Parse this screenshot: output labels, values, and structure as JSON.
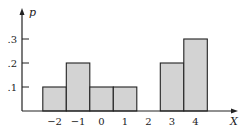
{
  "chart_data": {
    "type": "bar",
    "title": "",
    "xlabel": "X",
    "ylabel": "p",
    "categories": [
      "-2",
      "-1",
      "0",
      "1",
      "2",
      "3",
      "4"
    ],
    "values": [
      0.1,
      0.2,
      0.1,
      0.1,
      0.0,
      0.2,
      0.3
    ],
    "x_tick_labels": [
      "−2",
      "−1",
      "0",
      "1",
      "2",
      "3",
      "4"
    ],
    "y_tick_labels": [
      ".1",
      ".2",
      ".3"
    ],
    "y_ticks": [
      0.1,
      0.2,
      0.3
    ],
    "ylim": [
      0,
      0.42
    ],
    "grid": false,
    "legend": null,
    "bar_fill": "#d3d3d3",
    "bar_edge": "#222222"
  }
}
